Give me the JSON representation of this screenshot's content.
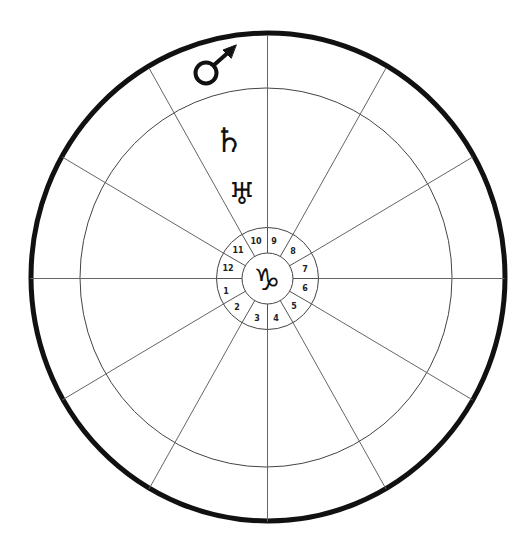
{
  "diagram": {
    "type": "astrological-chart-wheel",
    "colors": {
      "background": "#ffffff",
      "outer_ring": "#111111",
      "lines": "#555555",
      "text": "#222222"
    },
    "center_sign": {
      "name": "capricorn",
      "glyph": "♑"
    },
    "houses": [
      {
        "number": "1",
        "x": 226,
        "y": 294
      },
      {
        "number": "2",
        "x": 237,
        "y": 310
      },
      {
        "number": "3",
        "x": 257,
        "y": 321
      },
      {
        "number": "4",
        "x": 276,
        "y": 321
      },
      {
        "number": "5",
        "x": 294,
        "y": 309
      },
      {
        "number": "6",
        "x": 305,
        "y": 291
      },
      {
        "number": "7",
        "x": 305,
        "y": 272
      },
      {
        "number": "8",
        "x": 293,
        "y": 254
      },
      {
        "number": "9",
        "x": 274,
        "y": 244
      },
      {
        "number": "10",
        "x": 256,
        "y": 244
      },
      {
        "number": "11",
        "x": 238,
        "y": 253
      },
      {
        "number": "12",
        "x": 228,
        "y": 271
      }
    ],
    "planets": [
      {
        "name": "mars",
        "glyph": "♂"
      },
      {
        "name": "saturn",
        "glyph": "♄"
      },
      {
        "name": "uranus",
        "glyph": "♅"
      }
    ]
  }
}
